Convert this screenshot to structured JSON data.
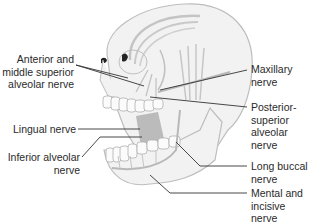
{
  "diagram": {
    "colors": {
      "skull_fill": "#f2f2f2",
      "skull_outline": "#bdbdbd",
      "nerve": "#b8b8b8",
      "muscle_shade": "#a8a8a8",
      "leader_line": "#333333",
      "text": "#2a2a2a"
    },
    "labels_left": [
      {
        "id": "anterior-middle-superior-alveolar",
        "text": "Anterior and\nmiddle superior\nalveolar nerve"
      },
      {
        "id": "lingual",
        "text": "Lingual nerve"
      },
      {
        "id": "inferior-alveolar",
        "text": "Inferior alveolar\nnerve"
      }
    ],
    "labels_right": [
      {
        "id": "maxillary",
        "text": "Maxillary\nnerve"
      },
      {
        "id": "posterior-superior-alveolar",
        "text": "Posterior-\nsuperior\nalveolar\nnerve"
      },
      {
        "id": "long-buccal",
        "text": "Long buccal\nnerve"
      },
      {
        "id": "mental-incisive",
        "text": "Mental and\nincisive\nnerve"
      }
    ]
  }
}
